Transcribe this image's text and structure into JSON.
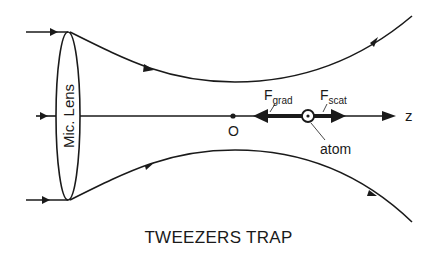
{
  "diagram": {
    "title": "TWEEZERS TRAP",
    "lens_label": "Mic. Lens",
    "axis_label": "z",
    "origin_label": "O",
    "atom_label": "atom",
    "force_grad": {
      "main": "F",
      "sub": "grad"
    },
    "force_scat": {
      "main": "F",
      "sub": "scat"
    },
    "stroke_color": "#1a1a1a",
    "background_color": "#ffffff"
  }
}
